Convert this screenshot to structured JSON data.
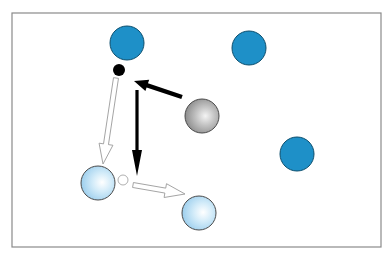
{
  "diagram": {
    "title": "",
    "frame": {
      "x": 12,
      "y": 13,
      "width": 369,
      "height": 234,
      "stroke": "#8a8a8a"
    },
    "colors": {
      "solid_blue": "#1e90c8",
      "solid_blue_stroke": "#0d4f6e",
      "light_blue": "#bfe3f7",
      "light_blue_stroke": "#4a4a4a",
      "gray": "#a8a8a8",
      "gray_stroke": "#4a4a4a",
      "black": "#000000",
      "hollow_stroke": "#9a9a9a"
    },
    "solid_circles": [
      {
        "id": "blue-circle-1",
        "cx": 127,
        "cy": 43,
        "r": 17
      },
      {
        "id": "blue-circle-2",
        "cx": 249,
        "cy": 48,
        "r": 17
      },
      {
        "id": "blue-circle-3",
        "cx": 297,
        "cy": 154,
        "r": 17
      }
    ],
    "gray_sphere": {
      "id": "gray-sphere",
      "cx": 202,
      "cy": 116,
      "r": 17
    },
    "light_spheres": [
      {
        "id": "light-blue-sphere-1",
        "cx": 98,
        "cy": 183,
        "r": 17
      },
      {
        "id": "light-blue-sphere-2",
        "cx": 199,
        "cy": 213,
        "r": 17
      }
    ],
    "black_dot": {
      "cx": 119,
      "cy": 70,
      "r": 6
    },
    "hollow_dot": {
      "cx": 123,
      "cy": 180,
      "r": 5
    },
    "arrows": [
      {
        "id": "black-arrow-diagonal",
        "style": "solid",
        "x1": 182,
        "y1": 97,
        "x2": 134,
        "y2": 81
      },
      {
        "id": "black-arrow-down",
        "style": "solid",
        "x1": 137,
        "y1": 90,
        "x2": 137,
        "y2": 176
      },
      {
        "id": "hollow-arrow-down",
        "style": "hollow",
        "x1": 116,
        "y1": 78,
        "x2": 103,
        "y2": 164
      },
      {
        "id": "hollow-arrow-right",
        "style": "hollow",
        "x1": 133,
        "y1": 185,
        "x2": 185,
        "y2": 194
      }
    ]
  }
}
